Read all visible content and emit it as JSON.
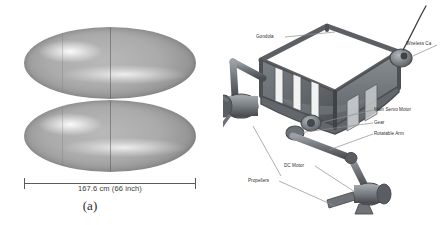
{
  "figure": {
    "panel_a": {
      "name": "blimp-envelope",
      "dimension_label": "167.6 cm (66 inch)",
      "caption": "(a)",
      "shapes": [
        {
          "name": "upper-ellipsoid-hull"
        },
        {
          "name": "lower-ellipsoid-hull"
        }
      ]
    },
    "panel_b": {
      "name": "gondola-assembly",
      "caption": "(b)",
      "labels": [
        {
          "id": "gondola",
          "text": "Gondola"
        },
        {
          "id": "wireless_camera",
          "text": "Wireless Ca"
        },
        {
          "id": "main_servo_motor",
          "text": "Main Servo Motor"
        },
        {
          "id": "gear",
          "text": "Gear"
        },
        {
          "id": "rotatable_arm",
          "text": "Rotatable Arm"
        },
        {
          "id": "dc_motor",
          "text": "DC Motor"
        },
        {
          "id": "propellers",
          "text": "Propellers"
        }
      ]
    }
  },
  "colors": {
    "hull_light": "#b9b9b9",
    "hull_mid": "#8f8f8f",
    "hull_dark": "#606060",
    "frame_body": "#6f7276",
    "frame_dark": "#4d5054",
    "frame_light": "#9aa0a4",
    "panel_white": "#f2f2f0",
    "leader_line": "#8d8d8d",
    "text": "#2f2f2f",
    "background": "#ffffff"
  }
}
